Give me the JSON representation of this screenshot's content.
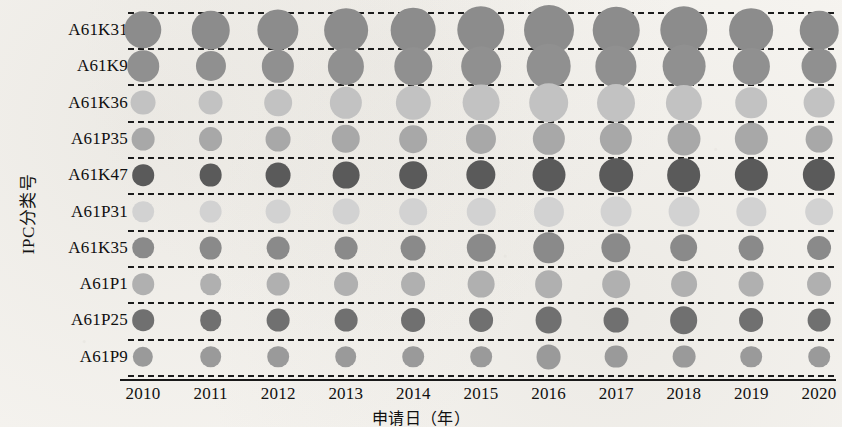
{
  "chart_data": {
    "type": "scatter",
    "title": "",
    "xlabel": "申请日（年）",
    "ylabel": "IPC分类号",
    "grid": true,
    "legend": "none",
    "categories": [
      "2010",
      "2011",
      "2012",
      "2013",
      "2014",
      "2015",
      "2016",
      "2017",
      "2018",
      "2019",
      "2020"
    ],
    "y_categories": [
      "A61K31",
      "A61K9",
      "A61K36",
      "A61P35",
      "A61K47",
      "A61P31",
      "A61K35",
      "A61P1",
      "A61P25",
      "A61P9"
    ],
    "size_encoding": "bubble area proportional to patent application count",
    "series": [
      {
        "name": "A61K31",
        "color": "#8c8c8c",
        "values": [
          26,
          28,
          33,
          38,
          40,
          46,
          52,
          44,
          46,
          38,
          28
        ]
      },
      {
        "name": "A61K9",
        "color": "#909090",
        "values": [
          17,
          15,
          18,
          24,
          26,
          30,
          40,
          33,
          36,
          24,
          22
        ]
      },
      {
        "name": "A61K36",
        "color": "#c2c2c2",
        "values": [
          9,
          9,
          12,
          18,
          21,
          25,
          30,
          27,
          24,
          17,
          16
        ]
      },
      {
        "name": "A61P35",
        "color": "#a8a8a8",
        "values": [
          7,
          8,
          9,
          13,
          12,
          15,
          18,
          18,
          19,
          18,
          11
        ]
      },
      {
        "name": "A61K47",
        "color": "#5a5a5a",
        "values": [
          6,
          7,
          9,
          11,
          12,
          14,
          19,
          20,
          20,
          18,
          18
        ]
      },
      {
        "name": "A61P31",
        "color": "#d2d2d2",
        "values": [
          6,
          7,
          9,
          11,
          12,
          13,
          15,
          16,
          16,
          14,
          12
        ]
      },
      {
        "name": "A61K35",
        "color": "#8a8a8a",
        "values": [
          6,
          7,
          7,
          7,
          9,
          13,
          17,
          14,
          12,
          9,
          8
        ]
      },
      {
        "name": "A61P1",
        "color": "#b0b0b0",
        "values": [
          6,
          6,
          7,
          8,
          8,
          11,
          12,
          12,
          10,
          9,
          8
        ]
      },
      {
        "name": "A61P25",
        "color": "#707070",
        "values": [
          6,
          6,
          7,
          7,
          8,
          8,
          11,
          9,
          12,
          8,
          7
        ]
      },
      {
        "name": "A61P9",
        "color": "#9a9a9a",
        "values": [
          5,
          6,
          6,
          6,
          6,
          6,
          9,
          7,
          7,
          6,
          6
        ]
      }
    ]
  },
  "axes": {
    "x_ticks": [
      "2010",
      "2011",
      "2012",
      "2013",
      "2014",
      "2015",
      "2016",
      "2017",
      "2018",
      "2019",
      "2020"
    ],
    "y_ticks": [
      "A61K31",
      "A61K9",
      "A61K36",
      "A61P35",
      "A61K47",
      "A61P31",
      "A61K35",
      "A61P1",
      "A61P25",
      "A61P9"
    ],
    "x_title": "申请日（年）",
    "y_title": "IPC分类号"
  }
}
